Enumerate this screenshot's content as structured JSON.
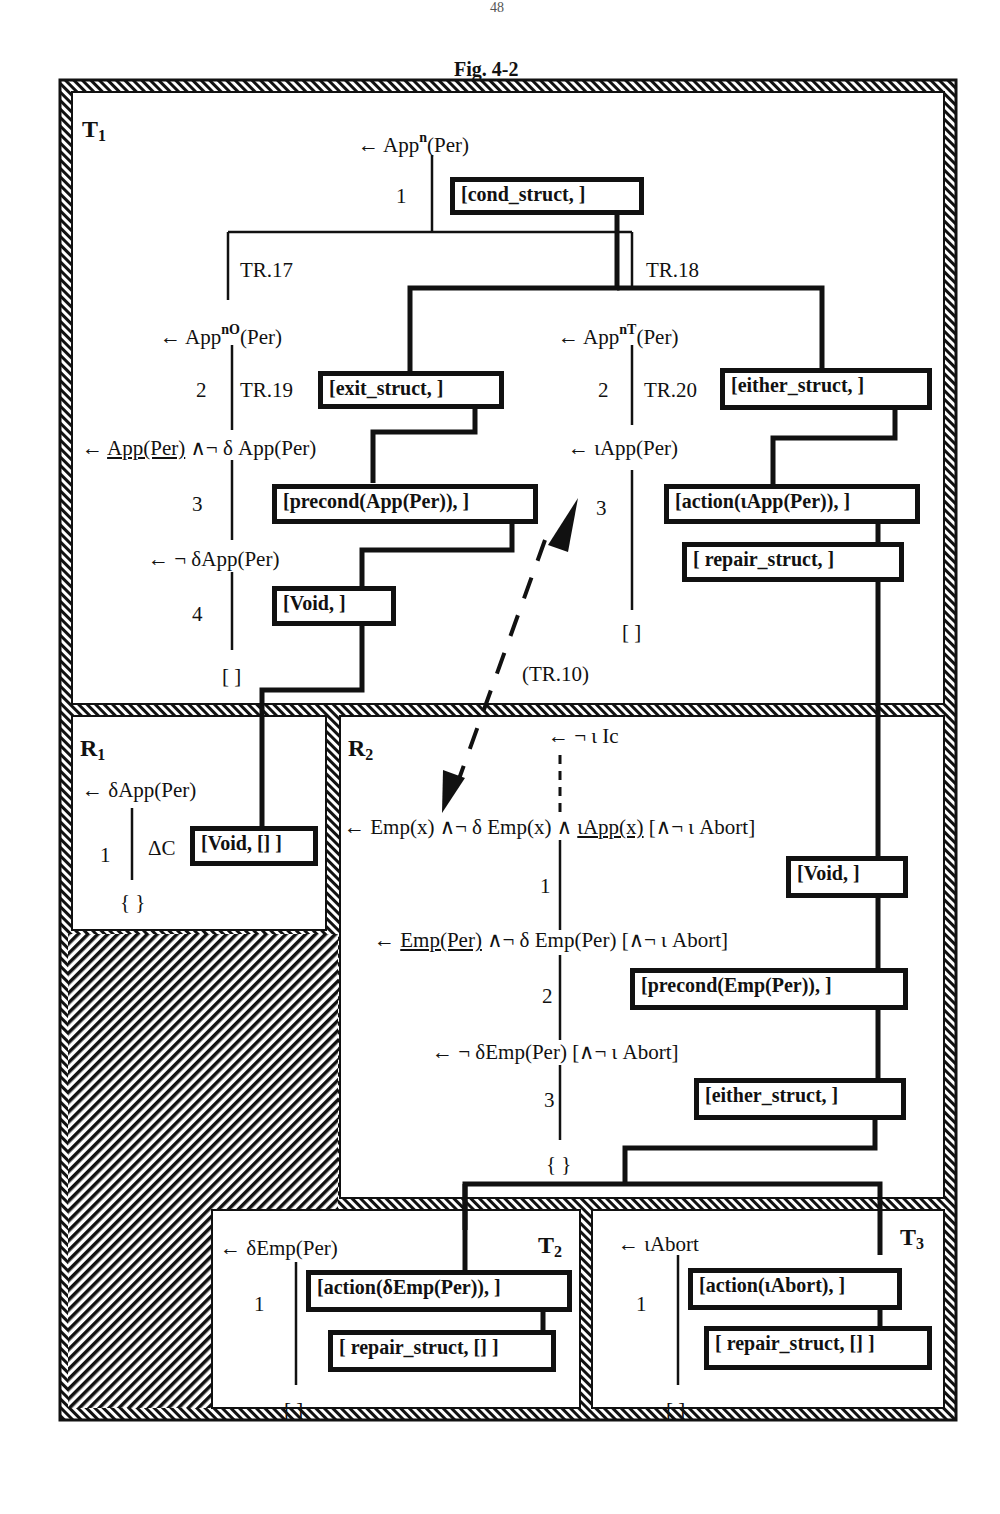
{
  "page": {
    "number": "48",
    "figure_title": "Fig.  4-2"
  },
  "regions": {
    "T1": {
      "label": "T",
      "sub": "1"
    },
    "R1": {
      "label": "R",
      "sub": "1"
    },
    "R2": {
      "label": "R",
      "sub": "2"
    },
    "T2": {
      "label": "T",
      "sub": "2"
    },
    "T3": {
      "label": "T",
      "sub": "3"
    }
  },
  "t1": {
    "root": {
      "prefix": "← App",
      "sup": "n",
      "suffix": "(Per)"
    },
    "step1": "1",
    "box_cond": "[cond_struct,   ]",
    "tr17": "TR.17",
    "tr18": "TR.18",
    "left": {
      "goal": {
        "prefix": "← App",
        "sup": "nO",
        "suffix": "(Per)"
      },
      "step2": "2",
      "tr19": "TR.19",
      "box_exit": "[exit_struct,   ]",
      "goal2_arrow": "←",
      "goal2_under": "App(Per)",
      "goal2_rest": " ∧¬ δ App(Per)",
      "step3": "3",
      "box_precond": "[precond(App(Per)),   ]",
      "goal3": "← ¬ δApp(Per)",
      "step4": "4",
      "box_void": "[Void,   ]",
      "end": "[ ]"
    },
    "right": {
      "goal": {
        "prefix": "← App",
        "sup": "nT",
        "suffix": "(Per)"
      },
      "step2": "2",
      "tr20": "TR.20",
      "box_either": "[either_struct,   ]",
      "goal2": "← ιApp(Per)",
      "step3": "3",
      "box_action": "[action(ιApp(Per)),   ]",
      "box_repair": "[ repair_struct,   ]",
      "end": "[ ]"
    },
    "tr10": "(TR.10)"
  },
  "r1": {
    "goal": "← δApp(Per)",
    "step1": "1",
    "delta": "ΔC",
    "box_void": "[Void, [] ]",
    "end": "{ }"
  },
  "r2": {
    "top": "← ¬ ι Ic",
    "goal1_pre": "← Emp(x) ∧¬ δ Emp(x) ∧ ",
    "goal1_under": "ιApp(x)",
    "goal1_post": " [∧¬ ι Abort]",
    "step1": "1",
    "box_void": "[Void,   ]",
    "goal2_arrow": "← ",
    "goal2_under": "Emp(Per)",
    "goal2_post": " ∧¬ δ Emp(Per) [∧¬ ι Abort]",
    "step2": "2",
    "box_precond": "[precond(Emp(Per)),   ]",
    "goal3": "← ¬ δEmp(Per) [∧¬ ι Abort]",
    "step3": "3",
    "box_either": "[either_struct,   ]",
    "end": "{ }"
  },
  "t2": {
    "goal": "← δEmp(Per)",
    "step1": "1",
    "box_action": "[action(δEmp(Per)),   ]",
    "box_repair": "[ repair_struct,  [] ]",
    "end": "[ ]"
  },
  "t3": {
    "goal": "← ιAbort",
    "step1": "1",
    "box_action": "[action(ιAbort),   ]",
    "box_repair": "[ repair_struct,  [] ]",
    "end": "[ ]"
  },
  "colors": {
    "ink": "#111111",
    "paper": "#ffffff"
  }
}
